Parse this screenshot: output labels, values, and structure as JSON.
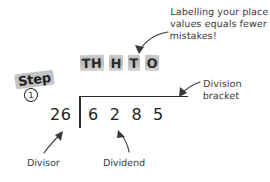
{
  "canvas": {
    "width": 270,
    "height": 182,
    "background": "#ffffff",
    "ink": "#3a3a3a"
  },
  "annotations": {
    "place_value_note": "Labelling your place\nvalues equals fewer\nmistakes!",
    "bracket_note": "Division\nbracket"
  },
  "place_values": {
    "tiles": [
      {
        "label": "TH"
      },
      {
        "label": "H"
      },
      {
        "label": "T"
      },
      {
        "label": "O"
      }
    ],
    "highlight_color": "#c4c4c4"
  },
  "step": {
    "word": "Step",
    "number": "1",
    "highlight_color": "#c4c4c4"
  },
  "problem": {
    "divisor": "26",
    "dividend_digits": [
      "6",
      "2",
      "8",
      "5"
    ],
    "dividend": "6285"
  },
  "labels": {
    "divisor": "Divisor",
    "dividend": "Dividend"
  },
  "icons": {
    "arrow_to_place_values": "curved-arrow-icon",
    "arrow_to_bracket": "curved-arrow-icon",
    "arrow_to_divisor": "curved-arrow-icon",
    "arrow_to_dividend": "curved-arrow-icon"
  }
}
